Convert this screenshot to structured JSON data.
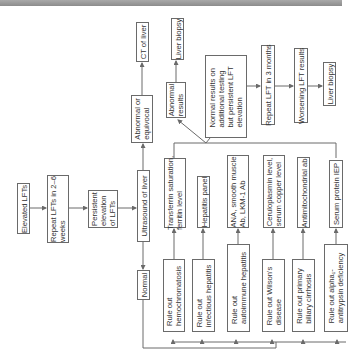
{
  "flowchart": {
    "title": "Evaluation of elevated LFTs",
    "orientation": "rotated 90 degrees counter-clockwise",
    "nodes": {
      "elevated": "Elevated LFTs",
      "repeat26": "Repeat LFTs in 2–6\nweeks",
      "persistent": "Persistent\nelevation\nof LFTs",
      "ultrasound": "Ultrasound of liver",
      "normal": "Normal",
      "abnormal_equivocal": "Abnormal or\nequivocal",
      "ct": "CT of liver",
      "abnormal_results": "Abnormal\nresults",
      "biopsy1": "Liver biopsy",
      "normal_results": "Normal results on\nadditional testing\nbut persistent LFT\nelevation",
      "repeat3": "Repeat LFT in 3 months",
      "worsening": "Worsening LFT results",
      "biopsy2": "Liver biopsy",
      "test_iron": "Transferrin saturation,\nferritin level",
      "test_hep": "Hepatitis panel",
      "test_auto": "ANA, smooth muscle\nAb, LKM-1 Ab",
      "test_cu": "Ceruloplasmin level,\nserum copper level",
      "test_ama": "Antimitochondrial ab",
      "test_iep": "Serum protein IEP",
      "ro_hemo": "Rule out\nhemochromatosis",
      "ro_infect": "Rule out\ninfectious hepatitis",
      "ro_auto": "Rule out\nautoimmune hepatitis",
      "ro_wilson": "Rule out Wilson's\ndisease",
      "ro_pbc": "Rule out primary\nbiliary cirrhosis",
      "ro_a1at": "Rule out alpha₁-\nantitrypsin deficiency"
    },
    "colors": {
      "line": "#6a6a6a",
      "text": "#333333",
      "topbar": "#9a9a9a"
    }
  }
}
